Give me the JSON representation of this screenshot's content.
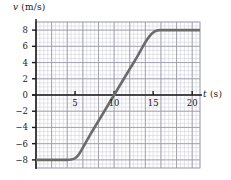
{
  "figure": {
    "background_color": "#ffffff",
    "curve_color": "#6b6b6b",
    "axis_color": "#1a1a1a",
    "grid_major_color": "#9a9aa8",
    "grid_minor_color": "#c9c9d4"
  },
  "chart_data": {
    "type": "line",
    "title": "",
    "subtitle": "",
    "xlabel": "t (s)",
    "xlabel_symbol": "t",
    "xlabel_unit": "(s)",
    "ylabel": "v (m/s)",
    "ylabel_symbol": "v",
    "ylabel_unit": "(m/s)",
    "xlim": [
      0,
      21
    ],
    "ylim": [
      -9,
      9
    ],
    "xticks": [
      5,
      10,
      15,
      20
    ],
    "xtick_labels": [
      "5",
      "10",
      "15",
      "20"
    ],
    "yticks": [
      -8,
      -6,
      -4,
      -2,
      0,
      2,
      4,
      6,
      8
    ],
    "ytick_labels": [
      "-8",
      "-6",
      "-4",
      "-2",
      "0",
      "2",
      "4",
      "6",
      "8"
    ],
    "grid": true,
    "grid_major_step_x": 2,
    "grid_major_step_y": 2,
    "grid_minor_step_x": 0.5,
    "grid_minor_step_y": 0.5,
    "legend": null,
    "series": [
      {
        "name": "velocity",
        "color": "#6b6b6b",
        "x": [
          0,
          1,
          2,
          3,
          4,
          4.5,
          5,
          5.5,
          6,
          7,
          8,
          9,
          10,
          11,
          12,
          13,
          14,
          14.5,
          15,
          15.5,
          16,
          17,
          18,
          19,
          20,
          21
        ],
        "y": [
          -8,
          -8,
          -8,
          -8,
          -8,
          -7.95,
          -7.8,
          -7.3,
          -6.5,
          -4.8,
          -3.2,
          -1.6,
          0,
          1.6,
          3.2,
          4.8,
          6.5,
          7.2,
          7.7,
          7.95,
          8,
          8,
          8,
          8,
          8,
          8
        ]
      }
    ],
    "annotations": [
      {
        "text": "constant v = -8 m/s from t = 0 to t ≈ 4.5 s"
      },
      {
        "text": "linear rise crossing v = 0 at t = 10 s"
      },
      {
        "text": "constant v = +8 m/s from t ≈ 16 s onward"
      }
    ]
  }
}
